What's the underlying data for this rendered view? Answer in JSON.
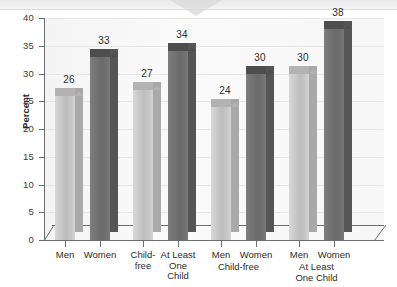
{
  "chart_data": {
    "type": "bar",
    "title": "",
    "subtitle": "",
    "xlabel": "",
    "ylabel": "Percent",
    "ylim": [
      0,
      40
    ],
    "ytick_step": 5,
    "ytick_labels": [
      "40",
      "35",
      "30",
      "25",
      "20",
      "15",
      "10",
      "5",
      "0"
    ],
    "grid": true,
    "legend": "none",
    "style": "3d-columns",
    "categories": [
      "Men",
      "Women",
      "Child-free",
      "At Least One Child",
      "Men",
      "Women",
      "Men",
      "Women"
    ],
    "values": [
      26,
      33,
      27,
      34,
      24,
      30,
      30,
      38
    ],
    "bar_shades": [
      "light",
      "dark",
      "light",
      "dark",
      "light",
      "dark",
      "light",
      "dark"
    ],
    "group_labels": [
      "",
      "Child-free",
      "At Least One Child"
    ],
    "bars": [
      {
        "label_lines": [
          "Men"
        ],
        "value": 26,
        "shade": "light",
        "group": ""
      },
      {
        "label_lines": [
          "Women"
        ],
        "value": 33,
        "shade": "dark",
        "group": ""
      },
      {
        "label_lines": [
          "Child-",
          "free"
        ],
        "value": 27,
        "shade": "light",
        "group": ""
      },
      {
        "label_lines": [
          "At Least",
          "One",
          "Child"
        ],
        "value": 34,
        "shade": "dark",
        "group": ""
      },
      {
        "label_lines": [
          "Men"
        ],
        "value": 24,
        "shade": "light",
        "group": "Child-free"
      },
      {
        "label_lines": [
          "Women"
        ],
        "value": 30,
        "shade": "dark",
        "group": "Child-free"
      },
      {
        "label_lines": [
          "Men"
        ],
        "value": 30,
        "shade": "light",
        "group": "At Least One Child"
      },
      {
        "label_lines": [
          "Women"
        ],
        "value": 38,
        "shade": "dark",
        "group": "At Least One Child"
      }
    ],
    "colors": {
      "light_bar": "#c9c9c9",
      "dark_bar": "#727272",
      "axis": "#6d6d6d",
      "gridline": "#e6e6e6",
      "plot_background": "#f7f7f7",
      "text": "#2b2b2b"
    }
  },
  "axis": {
    "y_title": "Percent",
    "ticks": [
      {
        "label": "40",
        "value": 40
      },
      {
        "label": "35",
        "value": 35
      },
      {
        "label": "30",
        "value": 30
      },
      {
        "label": "25",
        "value": 25
      },
      {
        "label": "20",
        "value": 20
      },
      {
        "label": "15",
        "value": 15
      },
      {
        "label": "10",
        "value": 10
      },
      {
        "label": "5",
        "value": 5
      },
      {
        "label": "0",
        "value": 0
      }
    ]
  },
  "group_captions": [
    {
      "lines": [
        "Child-free"
      ]
    },
    {
      "lines": [
        "At Least",
        "One Child"
      ]
    }
  ]
}
